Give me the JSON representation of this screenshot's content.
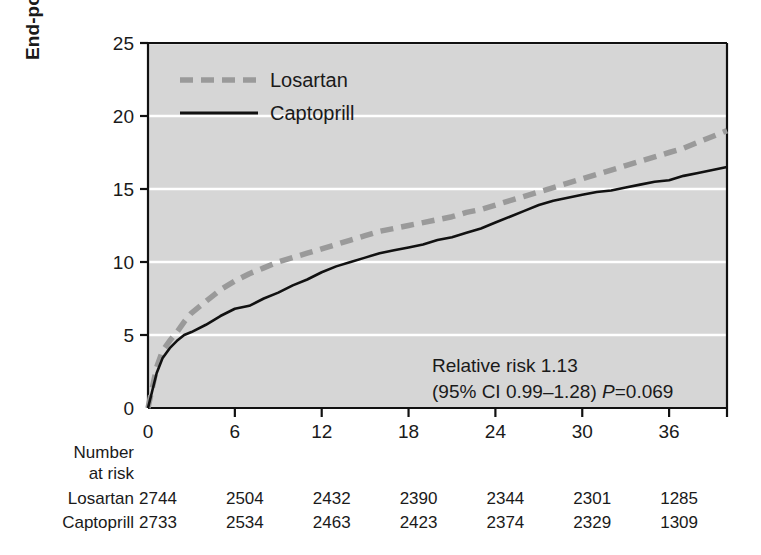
{
  "chart_data": {
    "type": "line",
    "title": "",
    "xlabel": "",
    "ylabel": "End-point rate (%)",
    "xlim": [
      0,
      40
    ],
    "ylim": [
      0,
      25
    ],
    "xticks": [
      0,
      6,
      12,
      18,
      24,
      30,
      36
    ],
    "yticks": [
      0,
      5,
      10,
      15,
      20,
      25
    ],
    "grid": "horizontal-white",
    "legend_position": "top-left",
    "plot_background": "#d6d6d6",
    "annotation_lines": [
      "Relative risk 1.13",
      "(95% CI 0.99–1.28) P=0.069"
    ],
    "annotation": {
      "line1": "Relative risk 1.13",
      "line2_prefix": "(95% CI 0.99–1.28) ",
      "line2_italic": "P",
      "line2_suffix": "=0.069"
    },
    "series": [
      {
        "name": "Losartan",
        "color": "#9a9a9a",
        "style": "dashed",
        "x": [
          0,
          0.3,
          0.6,
          1,
          1.5,
          2,
          2.5,
          3,
          4,
          5,
          6,
          7,
          8,
          9,
          10,
          11,
          12,
          13,
          14,
          15,
          16,
          17,
          18,
          19,
          20,
          21,
          22,
          23,
          24,
          25,
          26,
          27,
          28,
          29,
          30,
          31,
          32,
          33,
          34,
          35,
          36,
          37,
          38,
          39,
          40
        ],
        "y": [
          0,
          1.4,
          2.8,
          3.9,
          4.6,
          5.2,
          5.9,
          6.5,
          7.3,
          8.1,
          8.7,
          9.2,
          9.6,
          10.0,
          10.3,
          10.6,
          10.9,
          11.2,
          11.5,
          11.8,
          12.1,
          12.3,
          12.5,
          12.7,
          12.9,
          13.1,
          13.4,
          13.6,
          13.9,
          14.2,
          14.5,
          14.8,
          15.1,
          15.4,
          15.7,
          16.0,
          16.3,
          16.6,
          16.9,
          17.2,
          17.5,
          17.8,
          18.2,
          18.6,
          19.0
        ]
      },
      {
        "name": "Captoprill",
        "color": "#111111",
        "style": "solid",
        "x": [
          0,
          0.3,
          0.6,
          1,
          1.5,
          2,
          2.5,
          3,
          4,
          5,
          6,
          7,
          8,
          9,
          10,
          11,
          12,
          13,
          14,
          15,
          16,
          17,
          18,
          19,
          20,
          21,
          22,
          23,
          24,
          25,
          26,
          27,
          28,
          29,
          30,
          31,
          32,
          33,
          34,
          35,
          36,
          37,
          38,
          39,
          40
        ],
        "y": [
          0,
          1.2,
          2.4,
          3.4,
          4.1,
          4.6,
          5.0,
          5.2,
          5.7,
          6.3,
          6.8,
          7.0,
          7.5,
          7.9,
          8.4,
          8.8,
          9.3,
          9.7,
          10.0,
          10.3,
          10.6,
          10.8,
          11.0,
          11.2,
          11.5,
          11.7,
          12.0,
          12.3,
          12.7,
          13.1,
          13.5,
          13.9,
          14.2,
          14.4,
          14.6,
          14.8,
          14.9,
          15.1,
          15.3,
          15.5,
          15.6,
          15.9,
          16.1,
          16.3,
          16.5
        ]
      }
    ],
    "risk_table": {
      "heading_line1": "Number",
      "heading_line2": "at risk",
      "times": [
        0,
        6,
        12,
        18,
        24,
        30,
        36
      ],
      "rows": [
        {
          "label": "Losartan",
          "values": [
            "2744",
            "2504",
            "2432",
            "2390",
            "2344",
            "2301",
            "1285"
          ]
        },
        {
          "label": "Captoprill",
          "values": [
            "2733",
            "2534",
            "2463",
            "2423",
            "2374",
            "2329",
            "1309"
          ]
        }
      ]
    }
  }
}
